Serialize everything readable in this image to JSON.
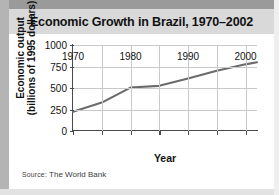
{
  "figure": {
    "title": "Economic Growth in Brazil, 1970–2002",
    "source_prefix": "Source",
    "source_rest": ": The World Bank",
    "source_full": "SOURCE: The World Bank"
  },
  "chart_data": {
    "type": "line",
    "title": "Economic Growth in Brazil, 1970–2002",
    "xlabel": "Year",
    "ylabel": "Economic output (billions of 1995 dollars)",
    "ylabel_line1": "Economic output",
    "ylabel_line2": "(billions of 1995 dollars)",
    "xlim": [
      1970,
      2002
    ],
    "ylim": [
      0,
      1000
    ],
    "yticks": [
      0,
      250,
      500,
      750,
      1000
    ],
    "ytick_labels": [
      "0",
      "250",
      "500",
      "750",
      "1000"
    ],
    "xticks": [
      1970,
      1980,
      1990,
      2000
    ],
    "xtick_labels": [
      "1970",
      "1980",
      "1990",
      "2000"
    ],
    "x_minor_ticks": [
      1975,
      1985,
      1995
    ],
    "grid": true,
    "grid_axis": "both",
    "legend": false,
    "line_color": "#6b6b6b",
    "series": [
      {
        "name": "Economic output",
        "x": [
          1970,
          1975,
          1980,
          1985,
          1990,
          1995,
          2000,
          2002
        ],
        "values": [
          225,
          330,
          505,
          525,
          610,
          700,
          775,
          800
        ]
      }
    ]
  }
}
